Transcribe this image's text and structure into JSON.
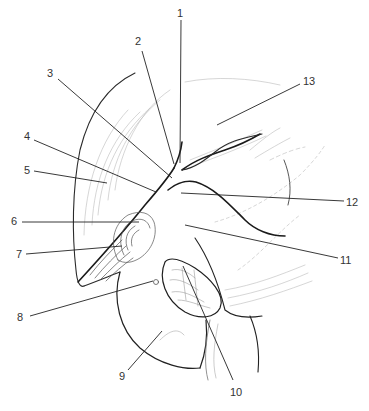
{
  "figure": {
    "type": "anatomical line drawing",
    "background": "#ffffff",
    "line_color": "#222222",
    "shade_color": "#9a9a9a"
  },
  "labels": [
    {
      "id": "1",
      "text": "1",
      "x": 177,
      "y": 8,
      "lx1": 181,
      "ly1": 20,
      "lx2": 180,
      "ly2": 163
    },
    {
      "id": "2",
      "text": "2",
      "x": 135,
      "y": 36,
      "lx1": 142,
      "ly1": 51,
      "lx2": 174,
      "ly2": 164
    },
    {
      "id": "3",
      "text": "3",
      "x": 47,
      "y": 68,
      "lx1": 58,
      "ly1": 79,
      "lx2": 172,
      "ly2": 178
    },
    {
      "id": "4",
      "text": "4",
      "x": 24,
      "y": 131,
      "lx1": 34,
      "ly1": 140,
      "lx2": 156,
      "ly2": 192
    },
    {
      "id": "5",
      "text": "5",
      "x": 24,
      "y": 165,
      "lx1": 34,
      "ly1": 171,
      "lx2": 107,
      "ly2": 183
    },
    {
      "id": "6",
      "text": "6",
      "x": 11,
      "y": 216,
      "lx1": 22,
      "ly1": 222,
      "lx2": 139,
      "ly2": 222
    },
    {
      "id": "7",
      "text": "7",
      "x": 16,
      "y": 249,
      "lx1": 26,
      "ly1": 254,
      "lx2": 122,
      "ly2": 246
    },
    {
      "id": "8",
      "text": "8",
      "x": 17,
      "y": 312,
      "lx1": 30,
      "ly1": 316,
      "lx2": 153,
      "ly2": 281
    },
    {
      "id": "9",
      "text": "9",
      "x": 119,
      "y": 371,
      "lx1": 128,
      "ly1": 370,
      "lx2": 162,
      "ly2": 331
    },
    {
      "id": "10",
      "text": "10",
      "x": 230,
      "y": 387,
      "lx1": 233,
      "ly1": 380,
      "lx2": 183,
      "ly2": 266
    },
    {
      "id": "11",
      "text": "11",
      "x": 340,
      "y": 255,
      "lx1": 338,
      "ly1": 258,
      "lx2": 185,
      "ly2": 225
    },
    {
      "id": "12",
      "text": "12",
      "x": 346,
      "y": 197,
      "lx1": 344,
      "ly1": 201,
      "lx2": 181,
      "ly2": 193
    },
    {
      "id": "13",
      "text": "13",
      "x": 303,
      "y": 76,
      "lx1": 300,
      "ly1": 84,
      "lx2": 217,
      "ly2": 125
    }
  ]
}
